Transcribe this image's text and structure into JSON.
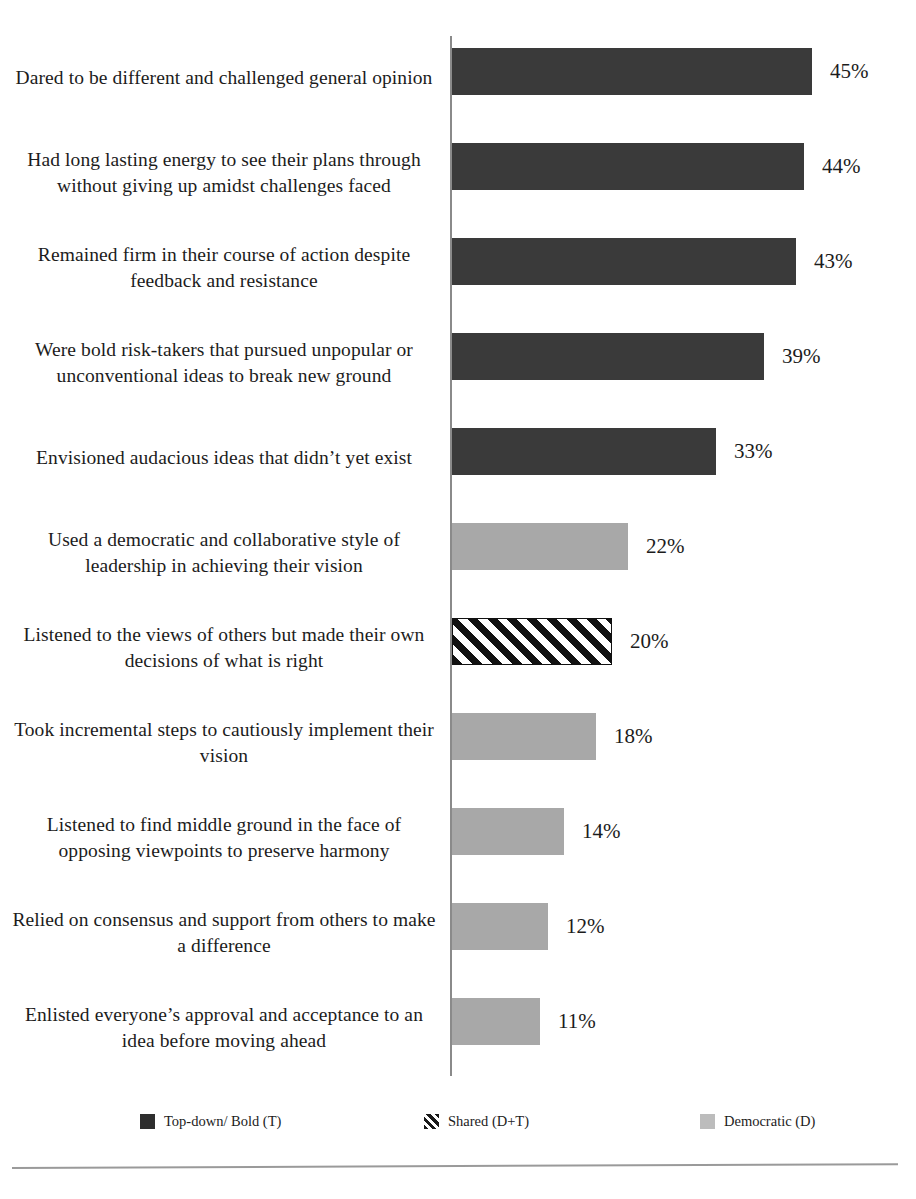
{
  "chart_data": {
    "type": "bar",
    "orientation": "horizontal",
    "title": "",
    "subtitle": "",
    "xlabel": "",
    "ylabel": "",
    "xlim": [
      0,
      50
    ],
    "grid": false,
    "value_suffix": "%",
    "legend_position": "bottom",
    "categories": [
      "Dared to be different and challenged general opinion",
      "Had long lasting energy to see their plans through without giving up  amidst challenges faced",
      "Remained firm in their course of action despite feedback and resistance",
      "Were bold risk-takers that pursued unpopular or unconventional ideas to break new ground",
      "Envisioned audacious  ideas that didn’t yet exist",
      "Used a democratic and collaborative style of leadership  in achieving their vision",
      "Listened to the views of others but made their own decisions of what is right",
      "Took incremental steps to cautiously implement their vision",
      "Listened to find middle ground in the face of opposing viewpoints  to preserve harmony",
      "Relied on consensus and support from others to make a difference",
      "Enlisted everyone’s approval and acceptance to an idea before moving ahead"
    ],
    "values": [
      45,
      44,
      43,
      39,
      33,
      22,
      20,
      18,
      14,
      12,
      11
    ],
    "value_labels": [
      "45%",
      "44%",
      "43%",
      "39%",
      "33%",
      "22%",
      "20%",
      "18%",
      "14%",
      "12%",
      "11%"
    ],
    "series_assignment": [
      "topdown",
      "topdown",
      "topdown",
      "topdown",
      "topdown",
      "democratic",
      "shared",
      "democratic",
      "democratic",
      "democratic",
      "democratic"
    ],
    "series": [
      {
        "key": "topdown",
        "name": "Top-down/ Bold (T)",
        "color": "#3a3a3a",
        "pattern": "solid"
      },
      {
        "key": "shared",
        "name": "Shared (D+T)",
        "color": "#111111",
        "pattern": "diagonal-stripes"
      },
      {
        "key": "democratic",
        "name": "Democratic (D)",
        "color": "#a8a8a8",
        "pattern": "solid"
      }
    ]
  },
  "legend": {
    "items": [
      {
        "label": "Top-down/ Bold (T)",
        "swatch": "topdown"
      },
      {
        "label": "Shared (D+T)",
        "swatch": "shared"
      },
      {
        "label": "Democratic (D)",
        "swatch": "democratic"
      }
    ]
  }
}
